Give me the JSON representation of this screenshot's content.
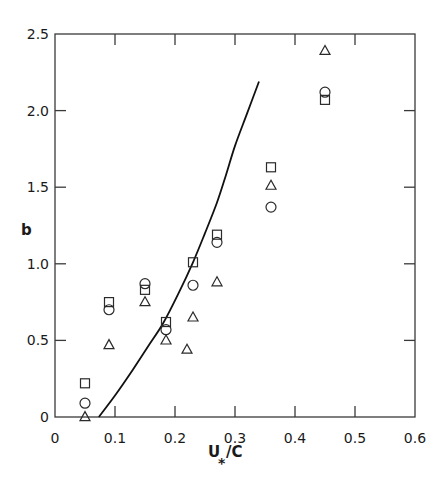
{
  "chart_data": {
    "type": "scatter",
    "title": "",
    "xlabel": "U*/C",
    "ylabel": "b",
    "xlim": [
      0,
      0.6
    ],
    "ylim": [
      0,
      2.5
    ],
    "grid": false,
    "legend": null,
    "x_ticks": [
      "0",
      "0.1",
      "0.2",
      "0.3",
      "0.4",
      "0.5",
      "0.6"
    ],
    "y_ticks": [
      "0",
      "0.5",
      "1.0",
      "1.5",
      "2.0",
      "2.5"
    ],
    "series": [
      {
        "name": "square",
        "marker": "square",
        "x": [
          0.05,
          0.09,
          0.15,
          0.185,
          0.23,
          0.27,
          0.36,
          0.45
        ],
        "y": [
          0.22,
          0.75,
          0.83,
          0.62,
          1.01,
          1.19,
          1.63,
          2.07
        ]
      },
      {
        "name": "circle",
        "marker": "circle",
        "x": [
          0.05,
          0.09,
          0.15,
          0.185,
          0.23,
          0.27,
          0.36,
          0.45
        ],
        "y": [
          0.09,
          0.7,
          0.87,
          0.57,
          0.86,
          1.14,
          1.37,
          2.12
        ]
      },
      {
        "name": "triangle",
        "marker": "triangle",
        "x": [
          0.05,
          0.09,
          0.15,
          0.185,
          0.22,
          0.23,
          0.27,
          0.36,
          0.45
        ],
        "y": [
          0.0,
          0.47,
          0.75,
          0.5,
          0.44,
          0.65,
          0.88,
          1.51,
          2.39
        ]
      },
      {
        "name": "curve",
        "marker": "line",
        "x": [
          0.073,
          0.1,
          0.13,
          0.155,
          0.18,
          0.205,
          0.23,
          0.25,
          0.27,
          0.285,
          0.3,
          0.32,
          0.34
        ],
        "y": [
          0.0,
          0.14,
          0.31,
          0.46,
          0.61,
          0.8,
          1.01,
          1.2,
          1.4,
          1.58,
          1.77,
          1.98,
          2.19
        ]
      }
    ]
  },
  "axes": {
    "x_label_main": "U",
    "x_label_sub": "*",
    "x_label_rest": "/C",
    "y_label": "b"
  }
}
